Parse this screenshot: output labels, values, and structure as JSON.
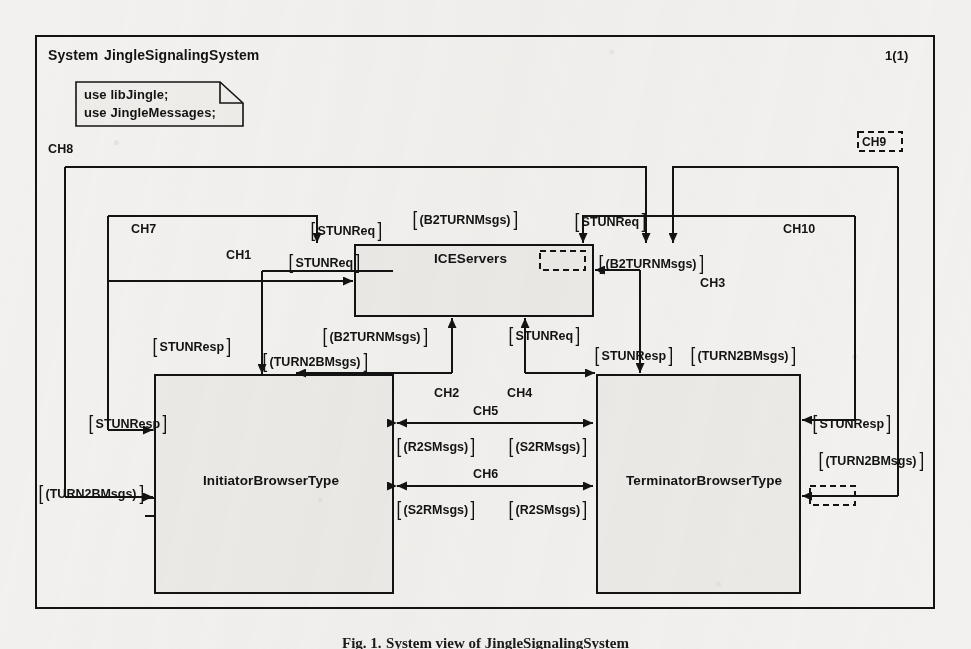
{
  "frame": {
    "system_keyword": "System",
    "system_name": "JingleSignalingSystem",
    "page_indicator": "1(1)"
  },
  "note": {
    "lines": [
      "use libJingle;",
      "use JingleMessages;"
    ]
  },
  "blocks": [
    {
      "id": "iceservers",
      "label": "ICEServers"
    },
    {
      "id": "initiator",
      "label": "InitiatorBrowserType"
    },
    {
      "id": "terminator",
      "label": "TerminatorBrowserType"
    }
  ],
  "channels": [
    {
      "id": "ch1",
      "label": "CH1"
    },
    {
      "id": "ch2",
      "label": "CH2"
    },
    {
      "id": "ch3",
      "label": "CH3"
    },
    {
      "id": "ch4",
      "label": "CH4"
    },
    {
      "id": "ch5",
      "label": "CH5"
    },
    {
      "id": "ch6",
      "label": "CH6"
    },
    {
      "id": "ch7",
      "label": "CH7"
    },
    {
      "id": "ch8",
      "label": "CH8"
    },
    {
      "id": "ch9",
      "label": "CH9"
    },
    {
      "id": "ch10",
      "label": "CH10"
    }
  ],
  "messages": {
    "m_top_left_stunreq": "STUNReq",
    "m_b2turn_top": "(B2TURNMsgs)",
    "m_top_right_stunreq": "STUNReq",
    "m_left_stunreq": "STUNReq",
    "m_b2turn_right": "(B2TURNMsgs)",
    "m_b2turn_below": "(B2TURNMsgs)",
    "m_stunreq_below": "STUNReq",
    "m_stunresp_left_upper": "STUNResp",
    "m_turn2b_left_of_init": "(TURN2BMsgs)",
    "m_stunresp_right_upper": "STUNResp",
    "m_turn2b_right_upper": "(TURN2BMsgs)",
    "m_stunresp_far_left": "STUNResp",
    "m_turn2b_far_left": "(TURN2BMsgs)",
    "m_stunresp_far_right": "STUNResp",
    "m_turn2b_far_right": "(TURN2BMsgs)",
    "m_r2s_upper": "(R2SMsgs)",
    "m_s2r_upper": "(S2RMsgs)",
    "m_s2r_lower": "(S2RMsgs)",
    "m_r2s_lower": "(R2SMsgs)"
  },
  "caption": {
    "prefix": "Fig. 1.",
    "text": "System view of JingleSignalingSystem"
  },
  "colors": {
    "paper": "#f2f1ef",
    "ink": "#131313",
    "block_fill": "#eceae7"
  }
}
